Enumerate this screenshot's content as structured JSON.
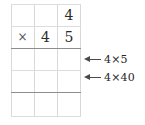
{
  "worksheet": {
    "type": "long-multiplication-grid",
    "columns": 3,
    "rows": 5,
    "grid": [
      [
        "",
        "",
        "4"
      ],
      [
        "×",
        "4",
        "5"
      ],
      [
        "",
        "",
        ""
      ],
      [
        "",
        "",
        ""
      ],
      [
        "",
        "",
        ""
      ]
    ],
    "operator_symbol": "×",
    "multiplicand": "4",
    "multiplier": "45",
    "rules": {
      "product_rule_after_row": 2,
      "sum_rule_after_row": 4
    }
  },
  "annotations": [
    {
      "id": "partial-product-units",
      "arrow": "arrow-left-icon",
      "label": "4×5",
      "target_row": 3
    },
    {
      "id": "partial-product-tens",
      "arrow": "arrow-left-icon",
      "label": "4×40",
      "target_row": 4
    }
  ],
  "colors": {
    "text": "#262626",
    "digit": "#2b2b2b",
    "rule": "#8d8d8d",
    "gridline": "#d8d8d8",
    "arrow": "#4a4a4a",
    "background": "#ffffff"
  }
}
